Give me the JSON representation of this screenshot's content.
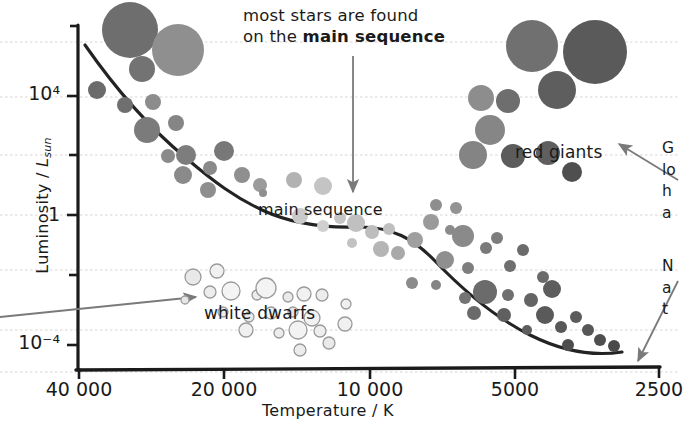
{
  "figure": {
    "kind": "hertzsprung-russell-diagram",
    "background": "#ffffff",
    "ink": "#1a1a1a",
    "grid_color": "#d8d2cc",
    "arrow_color": "#6b6b6b"
  },
  "annotations": {
    "top_line1": "most stars are found",
    "top_line2_plain": "on the ",
    "top_line2_bold": "main sequence",
    "main_sequence_label": "main sequence",
    "red_giants_label": "red giants",
    "white_dwarfs_label": "white dwarfs"
  },
  "right_margin_text": {
    "block1": [
      "G",
      "lo",
      "h",
      "a"
    ],
    "block2": [
      "N",
      "a",
      "t"
    ]
  },
  "chart_data": {
    "type": "scatter",
    "title": "",
    "xlabel": "Temperature / K",
    "ylabel": "Luminosity / L_sun",
    "xtick_labels": [
      "40 000",
      "20 000",
      "10 000",
      "5000",
      "2500"
    ],
    "xtick_values": [
      40000,
      20000,
      10000,
      5000,
      2500
    ],
    "x_axis_reversed": true,
    "x_scale": "log",
    "ytick_labels": [
      "10⁴",
      "1",
      "10⁻⁴"
    ],
    "ytick_values": [
      10000,
      1,
      0.0001
    ],
    "y_scale": "log",
    "ylim": [
      2e-05,
      200000
    ],
    "grid": true,
    "grid_rows": [
      42,
      97,
      155,
      215,
      270,
      330,
      372
    ],
    "legend": "none",
    "groups": [
      {
        "name": "main sequence",
        "color": "#8c8c8c",
        "points": [
          {
            "x": 130,
            "y": 30,
            "r": 28,
            "c": "#6e6e6e"
          },
          {
            "x": 178,
            "y": 50,
            "r": 26,
            "c": "#8f8f8f"
          },
          {
            "x": 142,
            "y": 69,
            "r": 13,
            "c": "#737373"
          },
          {
            "x": 97,
            "y": 90,
            "r": 9,
            "c": "#6b6b6b"
          },
          {
            "x": 125,
            "y": 105,
            "r": 8,
            "c": "#6f6f6f"
          },
          {
            "x": 153,
            "y": 102,
            "r": 8,
            "c": "#8c8c8c"
          },
          {
            "x": 147,
            "y": 130,
            "r": 13,
            "c": "#7b7b7b"
          },
          {
            "x": 176,
            "y": 123,
            "r": 8,
            "c": "#858585"
          },
          {
            "x": 168,
            "y": 156,
            "r": 7,
            "c": "#8a8a8a"
          },
          {
            "x": 186,
            "y": 155,
            "r": 10,
            "c": "#7d7d7d"
          },
          {
            "x": 210,
            "y": 168,
            "r": 7,
            "c": "#8a8a8a"
          },
          {
            "x": 183,
            "y": 175,
            "r": 9,
            "c": "#8a8a8a"
          },
          {
            "x": 208,
            "y": 190,
            "r": 8,
            "c": "#8e8e8e"
          },
          {
            "x": 224,
            "y": 151,
            "r": 10,
            "c": "#787878"
          },
          {
            "x": 242,
            "y": 175,
            "r": 8,
            "c": "#8f8f8f"
          },
          {
            "x": 260,
            "y": 185,
            "r": 7,
            "c": "#9b9b9b"
          },
          {
            "x": 294,
            "y": 180,
            "r": 8,
            "c": "#b2b2b2"
          },
          {
            "x": 323,
            "y": 186,
            "r": 9,
            "c": "#c4c4c4"
          },
          {
            "x": 263,
            "y": 193,
            "r": 4,
            "c": "#8f8f8f"
          },
          {
            "x": 300,
            "y": 216,
            "r": 8,
            "c": "#c9c9c9"
          },
          {
            "x": 323,
            "y": 226,
            "r": 6,
            "c": "#cfcfcf"
          },
          {
            "x": 340,
            "y": 218,
            "r": 6,
            "c": "#c6c6c6"
          },
          {
            "x": 356,
            "y": 223,
            "r": 9,
            "c": "#c0c0c0"
          },
          {
            "x": 372,
            "y": 232,
            "r": 7,
            "c": "#bdbdbd"
          },
          {
            "x": 389,
            "y": 229,
            "r": 6,
            "c": "#bfbfbf"
          },
          {
            "x": 352,
            "y": 243,
            "r": 5,
            "c": "#c2c2c2"
          },
          {
            "x": 381,
            "y": 249,
            "r": 8,
            "c": "#b5b5b5"
          },
          {
            "x": 398,
            "y": 253,
            "r": 7,
            "c": "#a9a9a9"
          },
          {
            "x": 415,
            "y": 240,
            "r": 8,
            "c": "#9f9f9f"
          },
          {
            "x": 431,
            "y": 222,
            "r": 8,
            "c": "#9a9a9a"
          },
          {
            "x": 436,
            "y": 205,
            "r": 6,
            "c": "#8e8e8e"
          },
          {
            "x": 456,
            "y": 208,
            "r": 6,
            "c": "#939393"
          },
          {
            "x": 450,
            "y": 230,
            "r": 5,
            "c": "#8b8b8b"
          },
          {
            "x": 463,
            "y": 236,
            "r": 11,
            "c": "#8a8a8a"
          },
          {
            "x": 445,
            "y": 260,
            "r": 9,
            "c": "#8f8f8f"
          },
          {
            "x": 468,
            "y": 268,
            "r": 6,
            "c": "#7e7e7e"
          },
          {
            "x": 486,
            "y": 248,
            "r": 6,
            "c": "#7a7a7a"
          },
          {
            "x": 497,
            "y": 238,
            "r": 6,
            "c": "#7d7d7d"
          },
          {
            "x": 510,
            "y": 266,
            "r": 6,
            "c": "#6f6f6f"
          },
          {
            "x": 523,
            "y": 250,
            "r": 6,
            "c": "#6b6b6b"
          },
          {
            "x": 485,
            "y": 292,
            "r": 12,
            "c": "#6b6b6b"
          },
          {
            "x": 508,
            "y": 295,
            "r": 6,
            "c": "#6f6f6f"
          },
          {
            "x": 465,
            "y": 298,
            "r": 6,
            "c": "#747474"
          },
          {
            "x": 474,
            "y": 313,
            "r": 7,
            "c": "#6a6a6a"
          },
          {
            "x": 504,
            "y": 315,
            "r": 7,
            "c": "#5f5f5f"
          },
          {
            "x": 531,
            "y": 300,
            "r": 7,
            "c": "#646464"
          },
          {
            "x": 543,
            "y": 277,
            "r": 6,
            "c": "#6a6a6a"
          },
          {
            "x": 552,
            "y": 289,
            "r": 9,
            "c": "#5d5d5d"
          },
          {
            "x": 545,
            "y": 315,
            "r": 9,
            "c": "#5a5a5a"
          },
          {
            "x": 561,
            "y": 327,
            "r": 6,
            "c": "#585858"
          },
          {
            "x": 576,
            "y": 317,
            "r": 6,
            "c": "#5b5b5b"
          },
          {
            "x": 588,
            "y": 330,
            "r": 6,
            "c": "#575757"
          },
          {
            "x": 600,
            "y": 340,
            "r": 6,
            "c": "#4f4f4f"
          },
          {
            "x": 568,
            "y": 345,
            "r": 6,
            "c": "#4d4d4d"
          },
          {
            "x": 614,
            "y": 346,
            "r": 6,
            "c": "#4a4a4a"
          },
          {
            "x": 527,
            "y": 330,
            "r": 5,
            "c": "#5e5e5e"
          },
          {
            "x": 436,
            "y": 285,
            "r": 5,
            "c": "#848484"
          },
          {
            "x": 412,
            "y": 283,
            "r": 6,
            "c": "#8b8b8b"
          }
        ]
      },
      {
        "name": "red giants",
        "color": "#6a6a6a",
        "points": [
          {
            "x": 532,
            "y": 46,
            "r": 26,
            "c": "#707070"
          },
          {
            "x": 595,
            "y": 52,
            "r": 32,
            "c": "#5a5a5a"
          },
          {
            "x": 557,
            "y": 90,
            "r": 19,
            "c": "#5e5e5e"
          },
          {
            "x": 481,
            "y": 98,
            "r": 13,
            "c": "#8d8d8d"
          },
          {
            "x": 508,
            "y": 101,
            "r": 12,
            "c": "#6e6e6e"
          },
          {
            "x": 490,
            "y": 130,
            "r": 15,
            "c": "#868686"
          },
          {
            "x": 473,
            "y": 155,
            "r": 14,
            "c": "#848484"
          },
          {
            "x": 513,
            "y": 156,
            "r": 12,
            "c": "#5c5c5c"
          },
          {
            "x": 548,
            "y": 153,
            "r": 12,
            "c": "#5f5f5f"
          },
          {
            "x": 572,
            "y": 172,
            "r": 10,
            "c": "#4f4f4f"
          }
        ]
      },
      {
        "name": "white dwarfs",
        "color": "#f2f2f2",
        "points": [
          {
            "x": 193,
            "y": 277,
            "r": 8,
            "c": "#e9e9e9"
          },
          {
            "x": 217,
            "y": 271,
            "r": 7,
            "c": "#f1f1f1"
          },
          {
            "x": 210,
            "y": 292,
            "r": 6,
            "c": "#ededed"
          },
          {
            "x": 231,
            "y": 291,
            "r": 9,
            "c": "#f4f4f4"
          },
          {
            "x": 257,
            "y": 295,
            "r": 5,
            "c": "#ececec"
          },
          {
            "x": 266,
            "y": 288,
            "r": 10,
            "c": "#f3f3f3"
          },
          {
            "x": 288,
            "y": 297,
            "r": 5,
            "c": "#eaeaea"
          },
          {
            "x": 304,
            "y": 294,
            "r": 7,
            "c": "#f1f1f1"
          },
          {
            "x": 322,
            "y": 295,
            "r": 6,
            "c": "#ededed"
          },
          {
            "x": 223,
            "y": 312,
            "r": 5,
            "c": "#ebebeb"
          },
          {
            "x": 249,
            "y": 317,
            "r": 5,
            "c": "#ebebeb"
          },
          {
            "x": 271,
            "y": 313,
            "r": 6,
            "c": "#f0f0f0"
          },
          {
            "x": 293,
            "y": 312,
            "r": 5,
            "c": "#e8e8e8"
          },
          {
            "x": 312,
            "y": 318,
            "r": 8,
            "c": "#f2f2f2"
          },
          {
            "x": 246,
            "y": 330,
            "r": 7,
            "c": "#f0f0f0"
          },
          {
            "x": 279,
            "y": 333,
            "r": 5,
            "c": "#ececec"
          },
          {
            "x": 298,
            "y": 330,
            "r": 9,
            "c": "#f3f3f3"
          },
          {
            "x": 320,
            "y": 331,
            "r": 6,
            "c": "#eeeeee"
          },
          {
            "x": 329,
            "y": 343,
            "r": 6,
            "c": "#eaeaea"
          },
          {
            "x": 345,
            "y": 324,
            "r": 7,
            "c": "#f0f0f0"
          },
          {
            "x": 300,
            "y": 350,
            "r": 6,
            "c": "#ececec"
          },
          {
            "x": 185,
            "y": 300,
            "r": 4,
            "c": "#e6e6e6"
          },
          {
            "x": 346,
            "y": 304,
            "r": 5,
            "c": "#efefef"
          }
        ]
      }
    ],
    "curve": "main sequence trend line from hot/luminous upper-left to cool/dim lower-right"
  }
}
